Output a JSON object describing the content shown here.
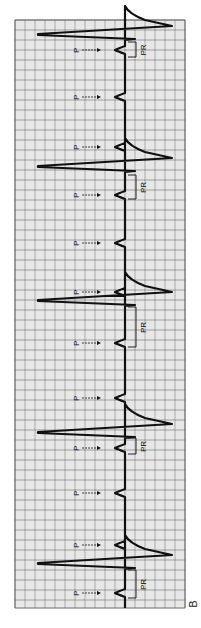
{
  "figure": {
    "label": "B",
    "orientation": "rotated-90-clockwise",
    "grid": {
      "x0": 15,
      "y0": 20,
      "x1": 185,
      "y1": 608,
      "minor": 2,
      "major": 10,
      "minor_color": "#bdbdbd",
      "major_color": "#6f6f6f"
    },
    "trace_color": "#111111",
    "baseline_x": 125
  },
  "chart_data": {
    "type": "line",
    "annotations": {
      "p_wave_label": "P",
      "pr_interval_label": "PR"
    },
    "qrs_y": [
      34,
      166,
      300,
      432,
      563
    ],
    "r_peak_x": 38,
    "s_trough_x": 172,
    "p_waves_y": [
      50,
      97,
      147,
      195,
      243,
      292,
      343,
      398,
      448,
      493,
      545,
      593
    ],
    "pr_brackets": [
      {
        "y_start": 42,
        "y_end": 57
      },
      {
        "y_start": 175,
        "y_end": 199
      },
      {
        "y_start": 307,
        "y_end": 347
      },
      {
        "y_start": 438,
        "y_end": 454
      },
      {
        "y_start": 570,
        "y_end": 598
      }
    ]
  }
}
